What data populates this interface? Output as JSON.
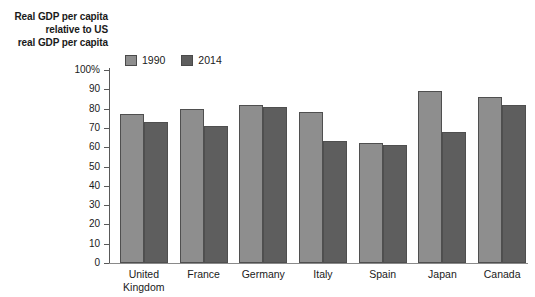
{
  "chart_data": {
    "type": "bar",
    "title": "",
    "ylabel": "Real GDP per capita relative to US real GDP per capita",
    "ylabel_lines": [
      "Real GDP per capita",
      "relative to US",
      "real GDP per capita"
    ],
    "xlabel": "",
    "ylim": [
      0,
      100
    ],
    "yticks": [
      0,
      10,
      20,
      30,
      40,
      50,
      60,
      70,
      80,
      90,
      100
    ],
    "ytick_labels": [
      "0",
      "10",
      "20",
      "30",
      "40",
      "50",
      "60",
      "70",
      "80",
      "90",
      "100%"
    ],
    "grid": false,
    "legend_position": "top-left",
    "categories": [
      "United Kingdom",
      "France",
      "Germany",
      "Italy",
      "Spain",
      "Japan",
      "Canada"
    ],
    "category_lines": [
      [
        "United",
        "Kingdom"
      ],
      [
        "France"
      ],
      [
        "Germany"
      ],
      [
        "Italy"
      ],
      [
        "Spain"
      ],
      [
        "Japan"
      ],
      [
        "Canada"
      ]
    ],
    "series": [
      {
        "name": "1990",
        "color": "#8e8e8e",
        "values": [
          77,
          80,
          82,
          78,
          62,
          89,
          86
        ]
      },
      {
        "name": "2014",
        "color": "#5e5e5e",
        "values": [
          73,
          71,
          81,
          63,
          61,
          68,
          82
        ]
      }
    ]
  },
  "colors": {
    "series_1990": "#8e8e8e",
    "series_2014": "#5e5e5e",
    "bar_outline": "#4f4f4f",
    "axis": "#595959",
    "text": "#1a1a1a",
    "background": "#ffffff"
  }
}
